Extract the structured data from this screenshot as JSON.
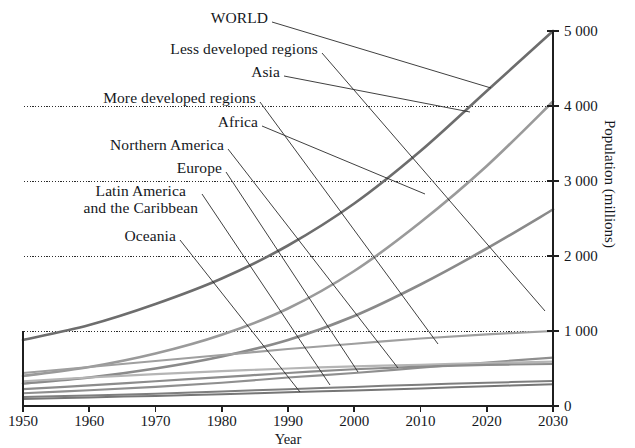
{
  "chart_data": {
    "type": "line",
    "title": "",
    "xlabel": "Year",
    "ylabel": "Population (millions)",
    "xlim": [
      1950,
      2030
    ],
    "ylim": [
      0,
      5000
    ],
    "xticks": [
      "1950",
      "1960",
      "1970",
      "1980",
      "1990",
      "2000",
      "2010",
      "2020",
      "2030"
    ],
    "yticks": [
      "0",
      "1 000",
      "2 000",
      "3 000",
      "4 000",
      "5 000"
    ],
    "grid": "horizontal-dotted at 1 000 / 2 000 / 3 000 / 4 000",
    "legend_position": "inline-labels-left-with-leader-lines",
    "x": [
      1950,
      1960,
      1970,
      1980,
      1990,
      2000,
      2010,
      2020,
      2030
    ],
    "series": [
      {
        "name": "WORLD",
        "color": "#6d6d6d",
        "width": 2.6,
        "values": [
          880,
          1080,
          1360,
          1700,
          2140,
          2700,
          3400,
          4200,
          5000
        ]
      },
      {
        "name": "Less developed regions",
        "color": "#9a9a9a",
        "width": 2.6,
        "values": [
          400,
          520,
          700,
          950,
          1300,
          1800,
          2450,
          3200,
          4060
        ]
      },
      {
        "name": "Asia",
        "color": "#8a8a8a",
        "width": 2.6,
        "values": [
          300,
          380,
          500,
          660,
          880,
          1200,
          1620,
          2100,
          2620
        ]
      },
      {
        "name": "More developed regions",
        "color": "#9f9f9f",
        "width": 2.2,
        "values": [
          440,
          520,
          600,
          680,
          760,
          830,
          900,
          955,
          1000
        ]
      },
      {
        "name": "Africa",
        "color": "#8f8f8f",
        "width": 2.2,
        "values": [
          170,
          210,
          255,
          310,
          380,
          440,
          510,
          580,
          645
        ]
      },
      {
        "name": "Northern America",
        "color": "#b5b5b5",
        "width": 2.2,
        "values": [
          330,
          380,
          425,
          465,
          500,
          528,
          550,
          572,
          592
        ]
      },
      {
        "name": "Europe",
        "color": "#8c8c8c",
        "width": 2.2,
        "values": [
          225,
          275,
          330,
          385,
          440,
          490,
          525,
          548,
          560
        ]
      },
      {
        "name": "Latin America and the Caribbean",
        "color": "#7e7e7e",
        "width": 2.0,
        "values": [
          120,
          140,
          165,
          195,
          225,
          255,
          285,
          310,
          332
        ]
      },
      {
        "name": "Oceania",
        "color": "#767676",
        "width": 2.0,
        "values": [
          95,
          115,
          135,
          158,
          182,
          208,
          235,
          262,
          290
        ]
      }
    ],
    "annotations": [
      {
        "label": "WORLD",
        "two_line": false
      },
      {
        "label": "Less developed regions",
        "two_line": false
      },
      {
        "label": "Asia",
        "two_line": false
      },
      {
        "label": "More developed regions",
        "two_line": false
      },
      {
        "label": "Africa",
        "two_line": false
      },
      {
        "label": "Northern America",
        "two_line": false
      },
      {
        "label": "Europe",
        "two_line": false
      },
      {
        "label": "Latin America",
        "two_line": true,
        "label2": "and the Caribbean"
      },
      {
        "label": "Oceania",
        "two_line": false
      }
    ]
  },
  "axes": {
    "x_title": "Year",
    "y_title": "Population (millions)",
    "x_ticks": [
      "1950",
      "1960",
      "1970",
      "1980",
      "1990",
      "2000",
      "2010",
      "2020",
      "2030"
    ],
    "y_ticks": [
      "0",
      "1 000",
      "2 000",
      "3 000",
      "4 000",
      "5 000"
    ]
  },
  "labels": {
    "world": "WORLD",
    "less_developed": "Less developed regions",
    "asia": "Asia",
    "more_developed": "More developed regions",
    "africa": "Africa",
    "northern_america": "Northern America",
    "europe": "Europe",
    "latin_america_1": "Latin America",
    "latin_america_2": "and the Caribbean",
    "oceania": "Oceania"
  },
  "colors": {
    "axis": "#1f1f1f",
    "grid": "#2b2b2b",
    "background": "#ffffff",
    "text": "#14171c"
  }
}
